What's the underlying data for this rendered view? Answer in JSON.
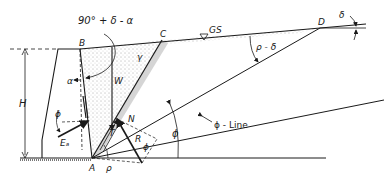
{
  "diagram": {
    "points": {
      "A": "A",
      "B": "B",
      "C": "C",
      "D": "D",
      "N": "N",
      "P": "P"
    },
    "labels": {
      "angle_top": "90° + δ - α",
      "alpha": "α",
      "weight": "W",
      "unit_weight": "γ",
      "ground_surface": "GS",
      "rho_minus_delta": "ρ - δ",
      "delta": "δ",
      "height": "H",
      "phi_wall": "ϕ",
      "active_force": "Eₐ",
      "tangential": "T",
      "resultant": "R",
      "phi_R": "ϕ",
      "rho": "ρ",
      "phi_angle": "ϕ",
      "phi_line": "ϕ - Line"
    },
    "colors": {
      "line": "#1a1a1a",
      "stipple": "#555555",
      "background": "#ffffff"
    }
  }
}
